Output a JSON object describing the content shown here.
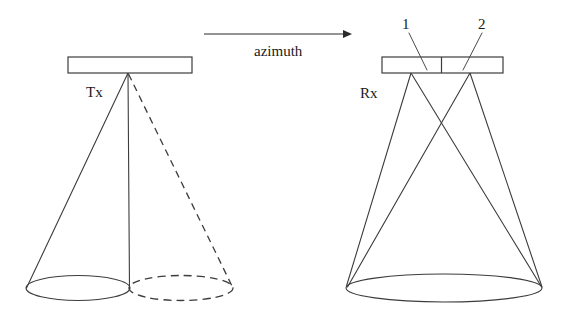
{
  "figure": {
    "background_color": "#ffffff",
    "line_color": "#3c3c3c",
    "width": 574,
    "height": 322
  },
  "axis": {
    "label": "azimuth",
    "arrow_direction": "right",
    "arrow": {
      "x1": 204,
      "y1": 34,
      "x2": 350,
      "y2": 34
    },
    "label_position": {
      "x": 278,
      "y": 45
    }
  },
  "transmit": {
    "label": "Tx",
    "label_position": {
      "x": 86,
      "y": 84
    },
    "antenna": {
      "x": 68,
      "y": 57,
      "width": 124,
      "height": 16
    },
    "apex": {
      "x": 128,
      "y": 73
    },
    "solid_beam_edge": {
      "x": 26,
      "y": 288
    },
    "center_line_end": {
      "x": 128,
      "y": 288
    },
    "dashed_beam_edge": {
      "x": 233,
      "y": 288
    },
    "footprint_solid": {
      "cx": 78,
      "cy": 288,
      "rx": 52,
      "ry": 13
    },
    "footprint_dashed": {
      "cx": 181,
      "cy": 288,
      "rx": 52,
      "ry": 13
    }
  },
  "receive": {
    "label": "Rx",
    "label_position": {
      "x": 360,
      "y": 86
    },
    "antenna": {
      "x": 382,
      "y": 57,
      "width": 121,
      "height": 16
    },
    "divider_x": 441,
    "elements": [
      {
        "id": "1",
        "label": "1",
        "label_position": {
          "x": 402,
          "y": 18
        },
        "leader": {
          "x1": 409,
          "y1": 33,
          "x2": 427,
          "y2": 70
        },
        "apex": {
          "x": 411,
          "y": 73
        }
      },
      {
        "id": "2",
        "label": "2",
        "label_position": {
          "x": 478,
          "y": 18
        },
        "leader": {
          "x1": 482,
          "y1": 33,
          "x2": 463,
          "y2": 70
        },
        "apex": {
          "x": 470,
          "y": 73
        }
      }
    ],
    "footprint": {
      "cx": 444,
      "cy": 288,
      "rx": 98,
      "ry": 14
    },
    "footprint_left_edge": {
      "x": 346,
      "y": 288
    },
    "footprint_right_edge": {
      "x": 542,
      "y": 288
    }
  }
}
